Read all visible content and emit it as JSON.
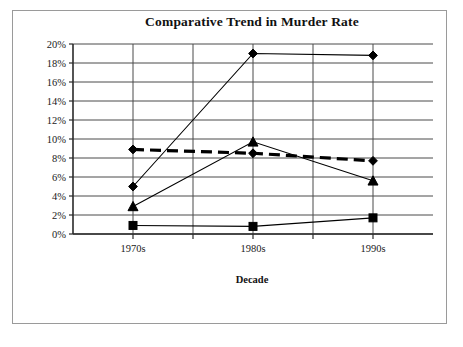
{
  "chart_data": {
    "type": "line",
    "title": "Comparative Trend in Murder Rate",
    "xlabel": "Decade",
    "ylabel": "",
    "categories": [
      "1970s",
      "1980s",
      "1990s"
    ],
    "ylim": [
      0,
      20
    ],
    "ytick_labels": [
      "0%",
      "2%",
      "4%",
      "6%",
      "8%",
      "10%",
      "12%",
      "14%",
      "16%",
      "18%",
      "20%"
    ],
    "ytick_values": [
      0,
      2,
      4,
      6,
      8,
      10,
      12,
      14,
      16,
      18,
      20
    ],
    "grid": "horizontal-and-vertical",
    "legend": "none",
    "series": [
      {
        "name": "series-steep-diamond",
        "marker": "diamond",
        "line_style": "solid",
        "values": [
          5.0,
          19.0,
          18.8
        ]
      },
      {
        "name": "series-flat-dashed-diamond",
        "marker": "diamond",
        "line_style": "dashed-thick",
        "values": [
          8.9,
          8.5,
          7.7
        ]
      },
      {
        "name": "series-peak-triangle",
        "marker": "triangle",
        "line_style": "solid",
        "values": [
          2.9,
          9.7,
          5.6
        ]
      },
      {
        "name": "series-low-square",
        "marker": "square",
        "line_style": "solid",
        "values": [
          0.9,
          0.8,
          1.7
        ]
      }
    ]
  },
  "layout": {
    "plot_left": 73,
    "plot_right": 433,
    "plot_top": 44,
    "plot_bottom": 234,
    "vertical_gridlines_x": [
      133,
      193,
      253,
      313,
      373
    ],
    "title_x": 252,
    "title_y": 26,
    "xlabel_x": 252,
    "xlabel_y": 283,
    "category_label_y": 252
  }
}
